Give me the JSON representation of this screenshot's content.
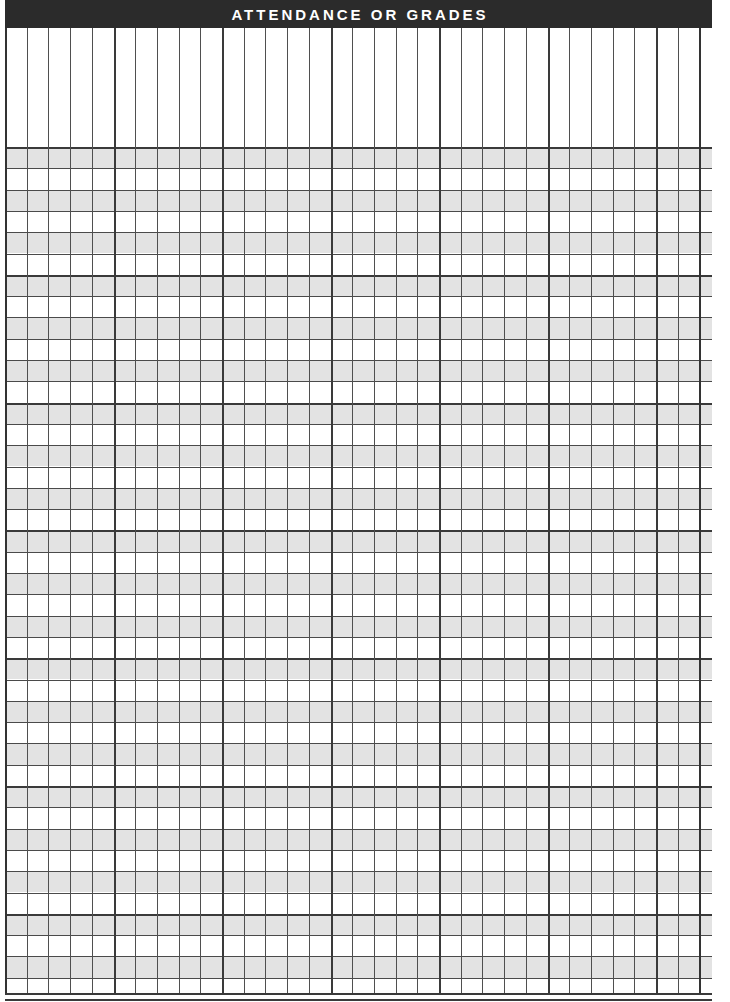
{
  "document": {
    "kind": "printable-form",
    "title": "ATTENDANCE OR GRADES",
    "page_width": 730,
    "page_height": 1002
  },
  "header_bar": {
    "label": "ATTENDANCE OR GRADES",
    "background_color": "#2b2b2b",
    "text_color": "#ffffff"
  },
  "grid": {
    "left": 5,
    "top": 28,
    "width": 707,
    "height": 967,
    "columns": 32,
    "column_width": 21.7,
    "column_group_size": 5,
    "header_region_height": 119,
    "body_rows": 40,
    "row_height": 21.3,
    "row_group_size": 6,
    "shaded_row_color": "#e3e3e3",
    "plain_row_color": "#ffffff",
    "rule_color": "#4f4f4f",
    "thick_rule_color": "#3a3a3a",
    "row_shading_pattern": "alternating",
    "header_region_has_horizontal_rules": false
  }
}
